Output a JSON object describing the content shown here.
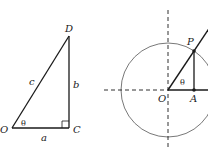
{
  "left_figure": {
    "labels": {
      "vertex_top": "D",
      "vertex_origin": "O",
      "vertex_right_angle": "C",
      "hypotenuse": "c",
      "opposite_side": "b",
      "adjacent_side": "a",
      "angle": "θ"
    }
  },
  "right_figure": {
    "labels": {
      "point_on_circle": "P",
      "center": "O",
      "foot": "A",
      "angle": "θ"
    }
  },
  "colors": {
    "stroke": "#1a1a1a",
    "circle": "#555555",
    "background": "#ffffff"
  }
}
